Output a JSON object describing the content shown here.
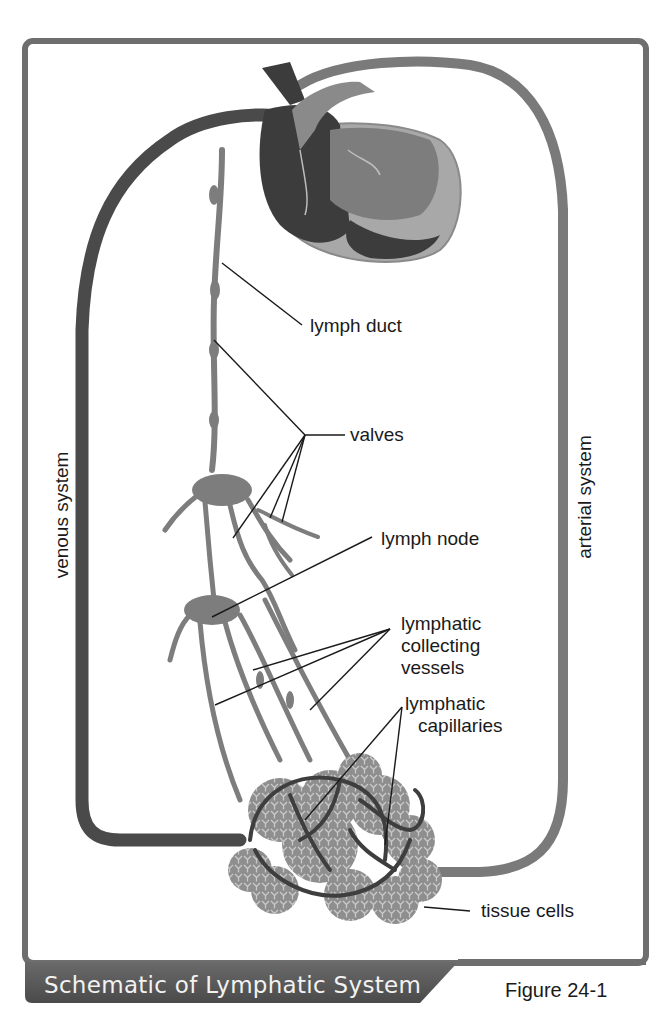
{
  "figure": {
    "caption_title": "Schematic of Lymphatic System",
    "figure_number": "Figure 24-1"
  },
  "side_labels": {
    "left": "venous system",
    "right": "arterial system"
  },
  "labels": [
    {
      "id": "lymph-duct",
      "lines": [
        "lymph duct"
      ]
    },
    {
      "id": "valves",
      "lines": [
        "valves"
      ]
    },
    {
      "id": "lymph-node",
      "lines": [
        "lymph node"
      ]
    },
    {
      "id": "collecting-vessels",
      "lines": [
        "lymphatic",
        "collecting",
        "vessels"
      ]
    },
    {
      "id": "capillaries",
      "lines": [
        "lymphatic",
        "capillaries"
      ]
    },
    {
      "id": "tissue-cells",
      "lines": [
        "tissue cells"
      ]
    }
  ],
  "colors": {
    "frame": "#6e6e6e",
    "venous": "#4a4a4a",
    "arterial": "#7a7a7a",
    "lymph": "#7d7d7d",
    "tissue": "#9a9a9a",
    "heart_dark": "#3c3c3c",
    "heart_light": "#a8a8a8",
    "caption_bar": "#5c5c5c"
  }
}
